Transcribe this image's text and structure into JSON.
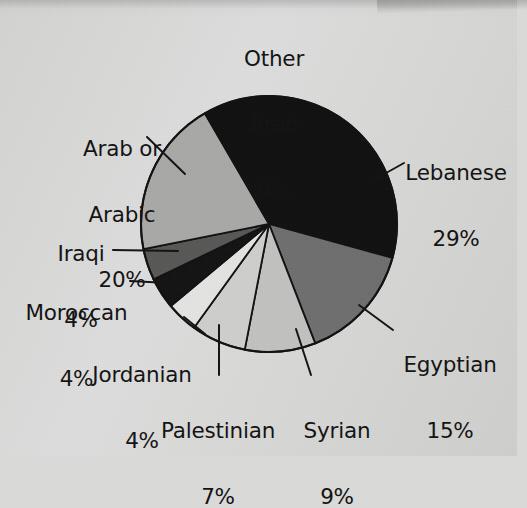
{
  "chart_data": {
    "type": "pie",
    "title": "",
    "subtitle": "",
    "xlabel": "",
    "ylabel": "",
    "legend_position": "none",
    "grid": false,
    "units": "percent",
    "total": 101,
    "categories": [
      "Lebanese",
      "Egyptian",
      "Syrian",
      "Palestinian",
      "Jordanian",
      "Moroccan",
      "Iraqi",
      "Arab or Arabic",
      "Other Arab"
    ],
    "values": [
      29,
      15,
      9,
      7,
      4,
      4,
      4,
      20,
      9
    ],
    "slices": [
      {
        "label": "Lebanese",
        "value": 29,
        "percent_text": "29%",
        "color": "#111111",
        "label_lines": [
          "Lebanese",
          "29%"
        ]
      },
      {
        "label": "Egyptian",
        "value": 15,
        "percent_text": "15%",
        "color": "#6f6f6f",
        "label_lines": [
          "Egyptian",
          "15%"
        ]
      },
      {
        "label": "Syrian",
        "value": 9,
        "percent_text": "9%",
        "color": "#c2c2c0",
        "label_lines": [
          "Syrian",
          "9%"
        ]
      },
      {
        "label": "Palestinian",
        "value": 7,
        "percent_text": "7%",
        "color": "#cfcfcd",
        "label_lines": [
          "Palestinian",
          "7%"
        ]
      },
      {
        "label": "Jordanian",
        "value": 4,
        "percent_text": "4%",
        "color": "#e4e4e2",
        "label_lines": [
          "Jordanian",
          "4%"
        ]
      },
      {
        "label": "Moroccan",
        "value": 4,
        "percent_text": "4%",
        "color": "#141414",
        "label_lines": [
          "Moroccan",
          "4%"
        ]
      },
      {
        "label": "Iraqi",
        "value": 4,
        "percent_text": "4%",
        "color": "#585856",
        "label_lines": [
          "Iraqi",
          "4%"
        ]
      },
      {
        "label": "Arab or Arabic",
        "value": 20,
        "percent_text": "20%",
        "color": "#a9a9a7",
        "label_lines": [
          "Arab or",
          "Arabic",
          "20%"
        ]
      },
      {
        "label": "Other Arab",
        "value": 9,
        "percent_text": "9%",
        "color": "#111111",
        "label_lines": [
          "Other",
          "Arab",
          "9%"
        ]
      }
    ]
  },
  "labels": {
    "other_arab": {
      "line1": "Other",
      "line2": "Arab",
      "pct": "9%"
    },
    "arab_or_arabic": {
      "line1": "Arab or",
      "line2": "Arabic",
      "pct": "20%"
    },
    "iraqi": {
      "line1": "Iraqi",
      "pct": "4%"
    },
    "moroccan": {
      "line1": "Moroccan",
      "pct": "4%"
    },
    "jordanian": {
      "line1": "Jordanian",
      "pct": "4%"
    },
    "palestinian": {
      "line1": "Palestinian",
      "pct": "7%"
    },
    "syrian": {
      "line1": "Syrian",
      "pct": "9%"
    },
    "egyptian": {
      "line1": "Egyptian",
      "pct": "15%"
    },
    "lebanese": {
      "line1": "Lebanese",
      "pct": "29%"
    }
  },
  "colors": {
    "background": "#d9d9d7",
    "text": "#131313",
    "outline": "#121212"
  }
}
